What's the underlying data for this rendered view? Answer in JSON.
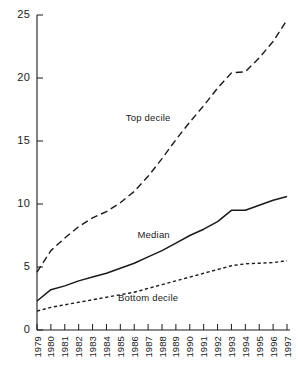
{
  "chart_data": {
    "type": "line",
    "title": "",
    "subtitle": "",
    "xlabel": "",
    "ylabel": "",
    "grid": false,
    "legend_position": "inline-annotations",
    "x": [
      1979,
      1980,
      1981,
      1982,
      1983,
      1984,
      1985,
      1986,
      1987,
      1988,
      1989,
      1990,
      1991,
      1992,
      1993,
      1994,
      1995,
      1996,
      1997
    ],
    "xtick_labels": [
      "1979",
      "1980",
      "1981",
      "1982",
      "1983",
      "1984",
      "1985",
      "1986",
      "1987",
      "1988",
      "1989",
      "1990",
      "1991",
      "1992",
      "1993",
      "1994",
      "1995",
      "1996",
      "1997"
    ],
    "xlim": [
      1979,
      1997
    ],
    "ylim": [
      0,
      25
    ],
    "ytick_labels": [
      "0",
      "5",
      "10",
      "15",
      "20",
      "25"
    ],
    "ytick_values": [
      0,
      5,
      10,
      15,
      20,
      25
    ],
    "series": [
      {
        "name": "Top decile",
        "style": "dashed",
        "label": "Top decile",
        "values": [
          4.6,
          6.3,
          7.3,
          8.2,
          8.9,
          9.4,
          10.1,
          11.0,
          12.2,
          13.6,
          15.1,
          16.5,
          17.8,
          19.2,
          20.4,
          20.5,
          21.6,
          22.9,
          24.6
        ]
      },
      {
        "name": "Median",
        "style": "solid",
        "label": "Median",
        "values": [
          2.3,
          3.2,
          3.5,
          3.9,
          4.2,
          4.5,
          4.9,
          5.3,
          5.8,
          6.3,
          6.9,
          7.5,
          8.0,
          8.6,
          9.5,
          9.5,
          9.9,
          10.3,
          10.6
        ]
      },
      {
        "name": "Bottom decile",
        "style": "dotted",
        "label": "Bottom decile",
        "values": [
          1.5,
          1.8,
          2.0,
          2.2,
          2.4,
          2.6,
          2.8,
          3.0,
          3.3,
          3.6,
          3.9,
          4.2,
          4.5,
          4.8,
          5.1,
          5.25,
          5.3,
          5.35,
          5.5
        ]
      }
    ],
    "annotations": [
      {
        "text": "Top decile",
        "x": 1987.0,
        "y": 16.6
      },
      {
        "text": "Median",
        "x": 1987.4,
        "y": 7.3
      },
      {
        "text": "Bottom decile",
        "x": 1987.0,
        "y": 2.3
      }
    ],
    "colors": {
      "axis": "#1a1a1a",
      "series": "#1a1a1a",
      "background": "#ffffff"
    }
  }
}
